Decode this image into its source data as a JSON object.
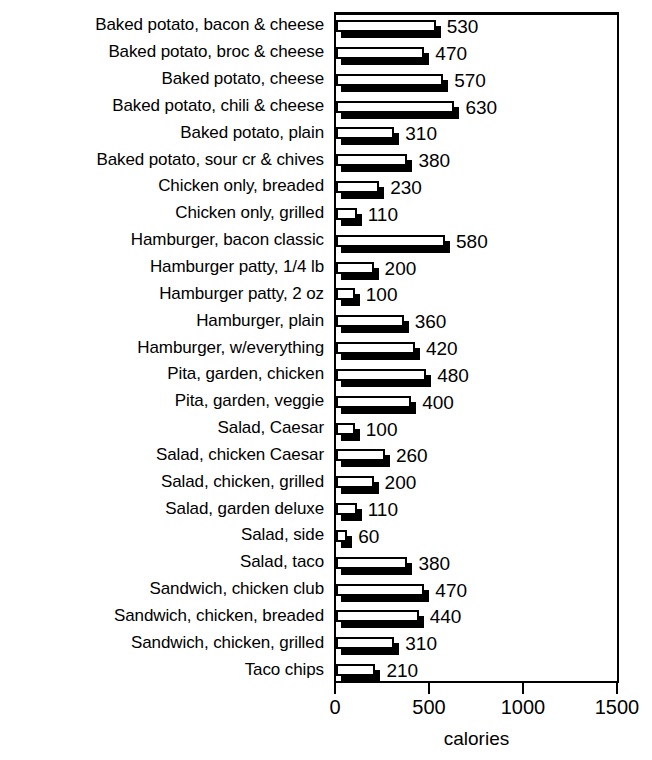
{
  "chart_data": {
    "type": "bar",
    "orientation": "horizontal",
    "title": "",
    "xlabel": "calories",
    "ylabel": "",
    "xlim": [
      0,
      1500
    ],
    "xticks": [
      0,
      500,
      1000,
      1500
    ],
    "xtick_labels": [
      "0",
      "500",
      "1000",
      "1500"
    ],
    "grid": false,
    "legend": null,
    "style": "3d-shadow-bars",
    "colors": {
      "bar_face": "#ffffff",
      "bar_outline": "#000000",
      "bar_shadow": "#000000",
      "axis": "#000000",
      "text": "#000000",
      "background": "#ffffff"
    },
    "categories": [
      "Baked potato, bacon & cheese",
      "Baked potato, broc & cheese",
      "Baked potato, cheese",
      "Baked potato, chili & cheese",
      "Baked potato, plain",
      "Baked potato, sour cr & chives",
      "Chicken only, breaded",
      "Chicken only, grilled",
      "Hamburger, bacon classic",
      "Hamburger patty, 1/4 lb",
      "Hamburger patty, 2 oz",
      "Hamburger, plain",
      "Hamburger, w/everything",
      "Pita, garden, chicken",
      "Pita, garden, veggie",
      "Salad, Caesar",
      "Salad, chicken Caesar",
      "Salad, chicken, grilled",
      "Salad, garden deluxe",
      "Salad, side",
      "Salad, taco",
      "Sandwich, chicken club",
      "Sandwich, chicken, breaded",
      "Sandwich, chicken, grilled",
      "Taco chips"
    ],
    "values": [
      530,
      470,
      570,
      630,
      310,
      380,
      230,
      110,
      580,
      200,
      100,
      360,
      420,
      480,
      400,
      100,
      260,
      200,
      110,
      60,
      380,
      470,
      440,
      310,
      210
    ],
    "value_labels": [
      "530",
      "470",
      "570",
      "630",
      "310",
      "380",
      "230",
      "110",
      "580",
      "200",
      "100",
      "360",
      "420",
      "480",
      "400",
      "100",
      "260",
      "200",
      "110",
      "60",
      "380",
      "470",
      "440",
      "310",
      "210"
    ]
  }
}
